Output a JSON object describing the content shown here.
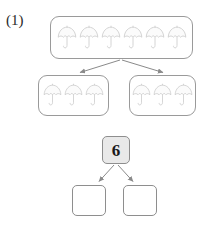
{
  "problem": {
    "label": "(1)",
    "type": "number-bond-decomposition"
  },
  "colors": {
    "box_stroke": "#9a9a9a",
    "arrow_stroke": "#8a8a8a",
    "number_box_fill": "#e9e9e9",
    "umbrella_stroke": "#c9c9c9",
    "umbrella_fill": "#fbfbfb",
    "text": "#1a1a1a"
  },
  "picture_model": {
    "whole_group": {
      "name": "umbrella-group-whole",
      "icon": "umbrella-icon",
      "count": 6,
      "items": [
        "umbrella",
        "umbrella",
        "umbrella",
        "umbrella",
        "umbrella",
        "umbrella"
      ]
    },
    "part_groups": [
      {
        "name": "umbrella-group-left",
        "icon": "umbrella-icon",
        "count": 3,
        "items": [
          "umbrella",
          "umbrella",
          "umbrella"
        ]
      },
      {
        "name": "umbrella-group-right",
        "icon": "umbrella-icon",
        "count": 3,
        "items": [
          "umbrella",
          "umbrella",
          "umbrella"
        ]
      }
    ]
  },
  "number_model": {
    "whole": {
      "name": "whole-number-box",
      "value": "6",
      "filled": true
    },
    "parts": [
      {
        "name": "part-number-box-left",
        "value": "",
        "filled": false
      },
      {
        "name": "part-number-box-right",
        "value": "",
        "filled": false
      }
    ]
  },
  "arrows": [
    {
      "name": "arrow-whole-to-left-group",
      "from": "whole-group",
      "to": "left-group"
    },
    {
      "name": "arrow-whole-to-right-group",
      "from": "whole-group",
      "to": "right-group"
    },
    {
      "name": "arrow-six-to-left-box",
      "from": "whole-number-box",
      "to": "part-number-box-left"
    },
    {
      "name": "arrow-six-to-right-box",
      "from": "whole-number-box",
      "to": "part-number-box-right"
    }
  ]
}
